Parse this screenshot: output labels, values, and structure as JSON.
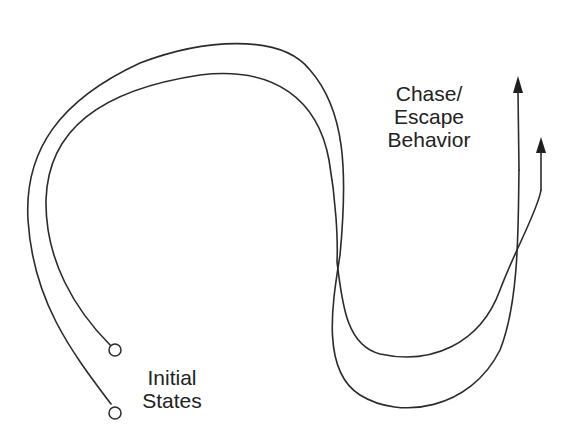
{
  "diagram": {
    "labels": {
      "behavior": [
        "Chase/",
        "Escape",
        "Behavior"
      ],
      "initial": [
        "Initial",
        "States"
      ]
    },
    "colors": {
      "stroke": "#2b2b2b",
      "background": "#ffffff",
      "text": "#222222"
    },
    "trajectories": [
      {
        "name": "trajectory-1",
        "start_marker": "open-circle",
        "end_marker": "arrowhead"
      },
      {
        "name": "trajectory-2",
        "start_marker": "open-circle",
        "end_marker": "arrowhead"
      }
    ]
  }
}
